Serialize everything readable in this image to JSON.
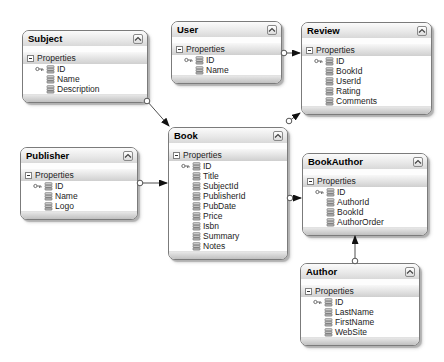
{
  "diagram": {
    "colors": {
      "box_border": "#7b7b7b",
      "connector": "#4f4f4f",
      "arrowhead": "#111111",
      "background": "#ffffff"
    },
    "entities": [
      {
        "id": "subject",
        "title": "Subject",
        "properties_label": "Properties",
        "fields": [
          {
            "label": "ID",
            "key": true
          },
          {
            "label": "Name",
            "key": false
          },
          {
            "label": "Description",
            "key": false
          }
        ]
      },
      {
        "id": "user",
        "title": "User",
        "properties_label": "Properties",
        "fields": [
          {
            "label": "ID",
            "key": true
          },
          {
            "label": "Name",
            "key": false
          }
        ]
      },
      {
        "id": "review",
        "title": "Review",
        "properties_label": "Properties",
        "fields": [
          {
            "label": "ID",
            "key": true
          },
          {
            "label": "BookId",
            "key": false
          },
          {
            "label": "UserId",
            "key": false
          },
          {
            "label": "Rating",
            "key": false
          },
          {
            "label": "Comments",
            "key": false
          }
        ]
      },
      {
        "id": "publisher",
        "title": "Publisher",
        "properties_label": "Properties",
        "fields": [
          {
            "label": "ID",
            "key": true
          },
          {
            "label": "Name",
            "key": false
          },
          {
            "label": "Logo",
            "key": false
          }
        ]
      },
      {
        "id": "book",
        "title": "Book",
        "properties_label": "Properties",
        "fields": [
          {
            "label": "ID",
            "key": true
          },
          {
            "label": "Title",
            "key": false
          },
          {
            "label": "SubjectId",
            "key": false
          },
          {
            "label": "PublisherId",
            "key": false
          },
          {
            "label": "PubDate",
            "key": false
          },
          {
            "label": "Price",
            "key": false
          },
          {
            "label": "Isbn",
            "key": false
          },
          {
            "label": "Summary",
            "key": false
          },
          {
            "label": "Notes",
            "key": false
          }
        ]
      },
      {
        "id": "bookauthor",
        "title": "BookAuthor",
        "properties_label": "Properties",
        "fields": [
          {
            "label": "ID",
            "key": true
          },
          {
            "label": "AuthorId",
            "key": false
          },
          {
            "label": "BookId",
            "key": false
          },
          {
            "label": "AuthorOrder",
            "key": false
          }
        ]
      },
      {
        "id": "author",
        "title": "Author",
        "properties_label": "Properties",
        "fields": [
          {
            "label": "ID",
            "key": true
          },
          {
            "label": "LastName",
            "key": false
          },
          {
            "label": "FirstName",
            "key": false
          },
          {
            "label": "WebSite",
            "key": false
          }
        ]
      }
    ],
    "relationships": [
      {
        "from": "Subject",
        "to": "Book"
      },
      {
        "from": "Publisher",
        "to": "Book"
      },
      {
        "from": "User",
        "to": "Review"
      },
      {
        "from": "Book",
        "to": "Review"
      },
      {
        "from": "Book",
        "to": "BookAuthor"
      },
      {
        "from": "Author",
        "to": "BookAuthor"
      }
    ]
  }
}
